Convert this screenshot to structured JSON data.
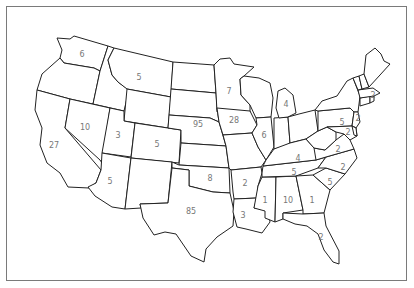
{
  "map": {
    "title": "",
    "type": "choropleth-outline",
    "region": "United States (contiguous)",
    "frame_color": "#7a7a7a",
    "outline_color": "#222222",
    "label_color": "#777777"
  },
  "labels": [
    {
      "state": "WA",
      "value": "6"
    },
    {
      "state": "MT",
      "value": "5"
    },
    {
      "state": "NV",
      "value": "10"
    },
    {
      "state": "UT",
      "value": "3"
    },
    {
      "state": "CA",
      "value": "27"
    },
    {
      "state": "CO",
      "value": "5"
    },
    {
      "state": "NE",
      "value": "95"
    },
    {
      "state": "MN",
      "value": "7"
    },
    {
      "state": "IA",
      "value": "28"
    },
    {
      "state": "IL",
      "value": "6"
    },
    {
      "state": "MI",
      "value": "4"
    },
    {
      "state": "NY",
      "value": "5"
    },
    {
      "state": "MA",
      "value": "2"
    },
    {
      "state": "NJ",
      "value": "2"
    },
    {
      "state": "MD",
      "value": "2"
    },
    {
      "state": "AZ",
      "value": "5"
    },
    {
      "state": "KS",
      "value": "8"
    },
    {
      "state": "TX",
      "value": "85"
    },
    {
      "state": "AR",
      "value": "2"
    },
    {
      "state": "LA",
      "value": "3"
    },
    {
      "state": "MS",
      "value": "1"
    },
    {
      "state": "AL",
      "value": "10"
    },
    {
      "state": "GA",
      "value": "1"
    },
    {
      "state": "SC",
      "value": "5"
    },
    {
      "state": "NC",
      "value": "2"
    },
    {
      "state": "VA",
      "value": "2"
    },
    {
      "state": "KY",
      "value": "4"
    },
    {
      "state": "TN",
      "value": "5"
    },
    {
      "state": "FL",
      "value": "2"
    }
  ]
}
